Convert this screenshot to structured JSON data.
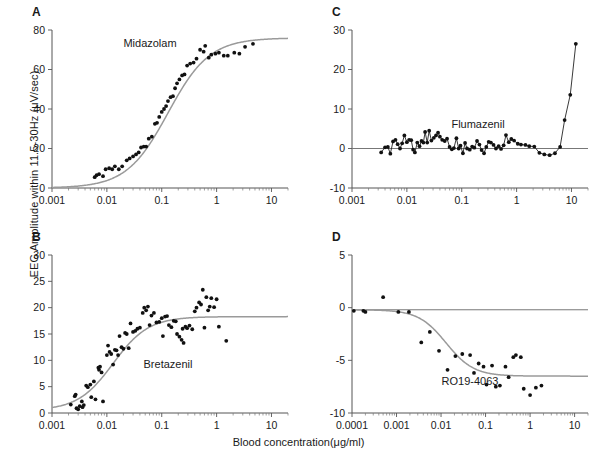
{
  "figure": {
    "ylabel": "EEG Amplitude within 11.5-30Hz (μV/sec)",
    "xlabel": "Blood concentration(μg/ml)",
    "background": "#ffffff",
    "point_color": "#111111",
    "curve_color": "#9a9a9a"
  },
  "panels": {
    "a": {
      "letter": "A",
      "drug": "Midazolam"
    },
    "b": {
      "letter": "B",
      "drug": "Bretazenil"
    },
    "c": {
      "letter": "C",
      "drug": "Flumazenil"
    },
    "d": {
      "letter": "D",
      "drug": "RO19-4063"
    }
  },
  "chart_data": [
    {
      "type": "scatter",
      "panel": "A",
      "title": "Midazolam",
      "xlabel": "Blood concentration(μg/ml)",
      "ylabel": "EEG Amplitude within 11.5-30Hz (μV/sec)",
      "xscale": "log",
      "xlim": [
        0.001,
        20
      ],
      "ylim": [
        0,
        80
      ],
      "xticks": [
        0.001,
        0.01,
        0.1,
        1,
        10
      ],
      "xticklabels": [
        "0.001",
        "0.01",
        "0.1",
        "1",
        "10"
      ],
      "yticks": [
        0,
        20,
        40,
        60,
        80
      ],
      "yticklabels": [
        "0",
        "20",
        "40",
        "60",
        "80"
      ],
      "grid": false,
      "legend": "none",
      "fit": {
        "model": "sigmoid_emax",
        "emax": 76,
        "ec50": 0.13,
        "hill": 1.15,
        "baseline": 0
      },
      "points": [
        {
          "x": 0.006,
          "y": 5.5
        },
        {
          "x": 0.0065,
          "y": 6.5
        },
        {
          "x": 0.0072,
          "y": 7.0
        },
        {
          "x": 0.0085,
          "y": 6.0
        },
        {
          "x": 0.0095,
          "y": 9.5
        },
        {
          "x": 0.011,
          "y": 10.0
        },
        {
          "x": 0.0125,
          "y": 9.5
        },
        {
          "x": 0.014,
          "y": 11.0
        },
        {
          "x": 0.0165,
          "y": 9.5
        },
        {
          "x": 0.019,
          "y": 11.0
        },
        {
          "x": 0.023,
          "y": 14.0
        },
        {
          "x": 0.026,
          "y": 15.0
        },
        {
          "x": 0.03,
          "y": 16.0
        },
        {
          "x": 0.034,
          "y": 17.0
        },
        {
          "x": 0.038,
          "y": 18.0
        },
        {
          "x": 0.042,
          "y": 20.5
        },
        {
          "x": 0.047,
          "y": 21.0
        },
        {
          "x": 0.052,
          "y": 21.0
        },
        {
          "x": 0.058,
          "y": 25.0
        },
        {
          "x": 0.066,
          "y": 26.0
        },
        {
          "x": 0.075,
          "y": 32.5
        },
        {
          "x": 0.082,
          "y": 33.0
        },
        {
          "x": 0.09,
          "y": 36.0
        },
        {
          "x": 0.1,
          "y": 38.5
        },
        {
          "x": 0.11,
          "y": 40.0
        },
        {
          "x": 0.12,
          "y": 41.5
        },
        {
          "x": 0.13,
          "y": 44.0
        },
        {
          "x": 0.145,
          "y": 46.0
        },
        {
          "x": 0.16,
          "y": 46.5
        },
        {
          "x": 0.175,
          "y": 50.5
        },
        {
          "x": 0.19,
          "y": 53.0
        },
        {
          "x": 0.21,
          "y": 55.0
        },
        {
          "x": 0.235,
          "y": 57.0
        },
        {
          "x": 0.26,
          "y": 57.5
        },
        {
          "x": 0.29,
          "y": 62.0
        },
        {
          "x": 0.33,
          "y": 63.0
        },
        {
          "x": 0.38,
          "y": 63.5
        },
        {
          "x": 0.43,
          "y": 65.5
        },
        {
          "x": 0.5,
          "y": 70.0
        },
        {
          "x": 0.58,
          "y": 69.0
        },
        {
          "x": 0.62,
          "y": 72.0
        },
        {
          "x": 0.72,
          "y": 66.0
        },
        {
          "x": 0.8,
          "y": 67.5
        },
        {
          "x": 0.95,
          "y": 68.0
        },
        {
          "x": 1.1,
          "y": 68.5
        },
        {
          "x": 1.35,
          "y": 67.0
        },
        {
          "x": 1.6,
          "y": 67.0
        },
        {
          "x": 2.1,
          "y": 68.5
        },
        {
          "x": 2.6,
          "y": 68.0
        },
        {
          "x": 3.3,
          "y": 71.5
        },
        {
          "x": 4.6,
          "y": 73.0
        }
      ]
    },
    {
      "type": "scatter",
      "panel": "B",
      "title": "Bretazenil",
      "xlabel": "Blood concentration(μg/ml)",
      "ylabel": "EEG Amplitude within 11.5-30Hz (μV/sec)",
      "xscale": "log",
      "xlim": [
        0.001,
        20
      ],
      "ylim": [
        0,
        30
      ],
      "xticks": [
        0.001,
        0.01,
        0.1,
        1,
        10
      ],
      "xticklabels": [
        "0.001",
        "0.01",
        "0.1",
        "1",
        "10"
      ],
      "yticks": [
        0,
        5,
        10,
        15,
        20,
        25,
        30
      ],
      "yticklabels": [
        "0",
        "5",
        "10",
        "15",
        "20",
        "25",
        "30"
      ],
      "grid": false,
      "legend": "none",
      "fit": {
        "model": "sigmoid_emax",
        "emax": 18.3,
        "ec50": 0.013,
        "hill": 1.35,
        "baseline": 0.5
      },
      "points": [
        {
          "x": 0.0022,
          "y": 1.6
        },
        {
          "x": 0.0026,
          "y": 3.2
        },
        {
          "x": 0.0027,
          "y": 3.5
        },
        {
          "x": 0.0028,
          "y": 0.9
        },
        {
          "x": 0.003,
          "y": 0.7
        },
        {
          "x": 0.0032,
          "y": 1.3
        },
        {
          "x": 0.0035,
          "y": 2.2
        },
        {
          "x": 0.0036,
          "y": 1.1
        },
        {
          "x": 0.0038,
          "y": 1.5
        },
        {
          "x": 0.0042,
          "y": 5.2
        },
        {
          "x": 0.0045,
          "y": 4.9
        },
        {
          "x": 0.005,
          "y": 5.4
        },
        {
          "x": 0.0052,
          "y": 3.0
        },
        {
          "x": 0.0058,
          "y": 6.0
        },
        {
          "x": 0.0062,
          "y": 2.6
        },
        {
          "x": 0.007,
          "y": 8.6
        },
        {
          "x": 0.0072,
          "y": 8.2
        },
        {
          "x": 0.0075,
          "y": 8.8
        },
        {
          "x": 0.008,
          "y": 7.7
        },
        {
          "x": 0.0085,
          "y": 2.2
        },
        {
          "x": 0.01,
          "y": 11.0
        },
        {
          "x": 0.0105,
          "y": 12.8
        },
        {
          "x": 0.0112,
          "y": 11.6
        },
        {
          "x": 0.012,
          "y": 11.2
        },
        {
          "x": 0.013,
          "y": 9.2
        },
        {
          "x": 0.014,
          "y": 12.0
        },
        {
          "x": 0.015,
          "y": 11.9
        },
        {
          "x": 0.016,
          "y": 11.0
        },
        {
          "x": 0.017,
          "y": 14.6
        },
        {
          "x": 0.0185,
          "y": 12.5
        },
        {
          "x": 0.02,
          "y": 12.2
        },
        {
          "x": 0.0215,
          "y": 15.2
        },
        {
          "x": 0.023,
          "y": 15.0
        },
        {
          "x": 0.025,
          "y": 12.3
        },
        {
          "x": 0.027,
          "y": 17.0
        },
        {
          "x": 0.03,
          "y": 15.4
        },
        {
          "x": 0.033,
          "y": 15.6
        },
        {
          "x": 0.036,
          "y": 16.0
        },
        {
          "x": 0.04,
          "y": 16.2
        },
        {
          "x": 0.045,
          "y": 19.0
        },
        {
          "x": 0.048,
          "y": 20.0
        },
        {
          "x": 0.052,
          "y": 19.5
        },
        {
          "x": 0.056,
          "y": 20.2
        },
        {
          "x": 0.06,
          "y": 16.7
        },
        {
          "x": 0.065,
          "y": 18.5
        },
        {
          "x": 0.072,
          "y": 19.0
        },
        {
          "x": 0.08,
          "y": 17.2
        },
        {
          "x": 0.09,
          "y": 17.3
        },
        {
          "x": 0.1,
          "y": 18.0
        },
        {
          "x": 0.105,
          "y": 14.6
        },
        {
          "x": 0.115,
          "y": 18.3
        },
        {
          "x": 0.125,
          "y": 18.4
        },
        {
          "x": 0.135,
          "y": 16.7
        },
        {
          "x": 0.15,
          "y": 16.3
        },
        {
          "x": 0.165,
          "y": 17.5
        },
        {
          "x": 0.18,
          "y": 17.4
        },
        {
          "x": 0.19,
          "y": 15.0
        },
        {
          "x": 0.21,
          "y": 14.5
        },
        {
          "x": 0.23,
          "y": 13.9
        },
        {
          "x": 0.24,
          "y": 16.0
        },
        {
          "x": 0.25,
          "y": 13.3
        },
        {
          "x": 0.27,
          "y": 16.4
        },
        {
          "x": 0.29,
          "y": 16.1
        },
        {
          "x": 0.32,
          "y": 16.6
        },
        {
          "x": 0.36,
          "y": 15.9
        },
        {
          "x": 0.4,
          "y": 19.3
        },
        {
          "x": 0.43,
          "y": 20.0
        },
        {
          "x": 0.48,
          "y": 21.0
        },
        {
          "x": 0.52,
          "y": 20.6
        },
        {
          "x": 0.56,
          "y": 23.4
        },
        {
          "x": 0.6,
          "y": 16.2
        },
        {
          "x": 0.65,
          "y": 22.0
        },
        {
          "x": 0.7,
          "y": 19.5
        },
        {
          "x": 0.75,
          "y": 20.2
        },
        {
          "x": 0.8,
          "y": 21.8
        },
        {
          "x": 0.9,
          "y": 20.1
        },
        {
          "x": 1.0,
          "y": 21.6
        },
        {
          "x": 1.1,
          "y": 16.4
        },
        {
          "x": 1.5,
          "y": 13.7
        }
      ]
    },
    {
      "type": "line",
      "panel": "C",
      "title": "Flumazenil",
      "xlabel": "Blood concentration(μg/ml)",
      "ylabel": "EEG Amplitude within 11.5-30Hz (μV/sec)",
      "xscale": "log",
      "xlim": [
        0.001,
        20
      ],
      "ylim": [
        -10,
        30
      ],
      "xticks": [
        0.001,
        0.01,
        0.1,
        1,
        10
      ],
      "xticklabels": [
        "0.001",
        "0.01",
        "0.1",
        "1",
        "10"
      ],
      "yticks": [
        -10,
        0,
        10,
        20,
        30
      ],
      "yticklabels": [
        "-10",
        "0",
        "10",
        "20",
        "30"
      ],
      "grid": false,
      "legend": "none",
      "markers": true,
      "zero_reference_line": 0,
      "points": [
        {
          "x": 0.0034,
          "y": -1.0
        },
        {
          "x": 0.004,
          "y": 0.3
        },
        {
          "x": 0.0045,
          "y": 0.4
        },
        {
          "x": 0.005,
          "y": -1.3
        },
        {
          "x": 0.0056,
          "y": 1.8
        },
        {
          "x": 0.0062,
          "y": 2.2
        },
        {
          "x": 0.0068,
          "y": 1.1
        },
        {
          "x": 0.0075,
          "y": 0.0
        },
        {
          "x": 0.0082,
          "y": 1.3
        },
        {
          "x": 0.009,
          "y": 3.3
        },
        {
          "x": 0.01,
          "y": 1.6
        },
        {
          "x": 0.011,
          "y": 2.2
        },
        {
          "x": 0.012,
          "y": 2.1
        },
        {
          "x": 0.013,
          "y": -0.3
        },
        {
          "x": 0.014,
          "y": -1.0
        },
        {
          "x": 0.0155,
          "y": 1.5
        },
        {
          "x": 0.017,
          "y": 0.6
        },
        {
          "x": 0.0185,
          "y": 1.9
        },
        {
          "x": 0.02,
          "y": 1.5
        },
        {
          "x": 0.0215,
          "y": 4.2
        },
        {
          "x": 0.0235,
          "y": 1.5
        },
        {
          "x": 0.0255,
          "y": 4.5
        },
        {
          "x": 0.028,
          "y": 2.0
        },
        {
          "x": 0.031,
          "y": 2.7
        },
        {
          "x": 0.034,
          "y": 3.3
        },
        {
          "x": 0.037,
          "y": 4.0
        },
        {
          "x": 0.04,
          "y": 3.0
        },
        {
          "x": 0.044,
          "y": 2.2
        },
        {
          "x": 0.049,
          "y": 1.9
        },
        {
          "x": 0.054,
          "y": 2.5
        },
        {
          "x": 0.06,
          "y": 0.4
        },
        {
          "x": 0.066,
          "y": -0.2
        },
        {
          "x": 0.072,
          "y": 0.1
        },
        {
          "x": 0.08,
          "y": 2.6
        },
        {
          "x": 0.088,
          "y": 0.0
        },
        {
          "x": 0.095,
          "y": 0.7
        },
        {
          "x": 0.105,
          "y": -1.2
        },
        {
          "x": 0.115,
          "y": 1.4
        },
        {
          "x": 0.125,
          "y": 0.0
        },
        {
          "x": 0.14,
          "y": -0.3
        },
        {
          "x": 0.155,
          "y": 0.5
        },
        {
          "x": 0.17,
          "y": 0.2
        },
        {
          "x": 0.19,
          "y": 1.9
        },
        {
          "x": 0.21,
          "y": 1.0
        },
        {
          "x": 0.23,
          "y": -0.4
        },
        {
          "x": 0.255,
          "y": -1.2
        },
        {
          "x": 0.28,
          "y": 0.4
        },
        {
          "x": 0.31,
          "y": 1.7
        },
        {
          "x": 0.34,
          "y": 1.5
        },
        {
          "x": 0.38,
          "y": 0.9
        },
        {
          "x": 0.42,
          "y": 0.0
        },
        {
          "x": 0.47,
          "y": 0.6
        },
        {
          "x": 0.52,
          "y": -0.1
        },
        {
          "x": 0.58,
          "y": 0.8
        },
        {
          "x": 0.64,
          "y": 3.4
        },
        {
          "x": 0.72,
          "y": 1.6
        },
        {
          "x": 0.8,
          "y": 2.4
        },
        {
          "x": 0.9,
          "y": 2.0
        },
        {
          "x": 1.05,
          "y": 1.2
        },
        {
          "x": 1.2,
          "y": 1.0
        },
        {
          "x": 1.45,
          "y": 0.9
        },
        {
          "x": 1.7,
          "y": 0.6
        },
        {
          "x": 2.1,
          "y": 0.5
        },
        {
          "x": 2.6,
          "y": -1.1
        },
        {
          "x": 3.2,
          "y": -1.5
        },
        {
          "x": 4.0,
          "y": -1.7
        },
        {
          "x": 5.0,
          "y": -1.2
        },
        {
          "x": 6.2,
          "y": 0.4
        },
        {
          "x": 7.5,
          "y": 7.2
        },
        {
          "x": 9.5,
          "y": 13.6
        },
        {
          "x": 12.0,
          "y": 26.5
        }
      ]
    },
    {
      "type": "scatter",
      "panel": "D",
      "title": "RO19-4063",
      "xlabel": "Blood concentration(μg/ml)",
      "ylabel": "EEG Amplitude within 11.5-30Hz (μV/sec)",
      "xscale": "log",
      "xlim": [
        0.0001,
        20
      ],
      "ylim": [
        -10,
        5
      ],
      "xticks": [
        0.0001,
        0.001,
        0.01,
        0.1,
        1,
        10
      ],
      "xticklabels": [
        "0.0001",
        "0.001",
        "0.01",
        "0.1",
        "1",
        "10"
      ],
      "yticks": [
        -10,
        -5,
        0,
        5
      ],
      "yticklabels": [
        "-10",
        "-5",
        "0",
        "5"
      ],
      "grid": false,
      "legend": "none",
      "zero_reference_line": -0.2,
      "fit": {
        "model": "inhibitory_sigmoid",
        "e0": -0.2,
        "emin": -6.5,
        "ic50": 0.013,
        "hill": 1.4
      },
      "points": [
        {
          "x": 0.00011,
          "y": -0.3
        },
        {
          "x": 0.00018,
          "y": -0.3
        },
        {
          "x": 0.0002,
          "y": -0.4
        },
        {
          "x": 0.0005,
          "y": 1.0
        },
        {
          "x": 0.0011,
          "y": -0.4
        },
        {
          "x": 0.0019,
          "y": -0.4
        },
        {
          "x": 0.0036,
          "y": -3.3
        },
        {
          "x": 0.0056,
          "y": -2.3
        },
        {
          "x": 0.009,
          "y": -4.1
        },
        {
          "x": 0.014,
          "y": -5.9
        },
        {
          "x": 0.021,
          "y": -4.6
        },
        {
          "x": 0.03,
          "y": -4.4
        },
        {
          "x": 0.045,
          "y": -4.5
        },
        {
          "x": 0.055,
          "y": -6.2
        },
        {
          "x": 0.07,
          "y": -5.3
        },
        {
          "x": 0.09,
          "y": -5.6
        },
        {
          "x": 0.105,
          "y": -7.3
        },
        {
          "x": 0.14,
          "y": -5.5
        },
        {
          "x": 0.17,
          "y": -7.5
        },
        {
          "x": 0.21,
          "y": -7.4
        },
        {
          "x": 0.28,
          "y": -5.6
        },
        {
          "x": 0.33,
          "y": -6.6
        },
        {
          "x": 0.42,
          "y": -4.7
        },
        {
          "x": 0.48,
          "y": -4.5
        },
        {
          "x": 0.62,
          "y": -4.7
        },
        {
          "x": 0.72,
          "y": -7.7
        },
        {
          "x": 1.0,
          "y": -8.3
        },
        {
          "x": 1.35,
          "y": -7.6
        },
        {
          "x": 1.8,
          "y": -7.4
        }
      ]
    }
  ]
}
